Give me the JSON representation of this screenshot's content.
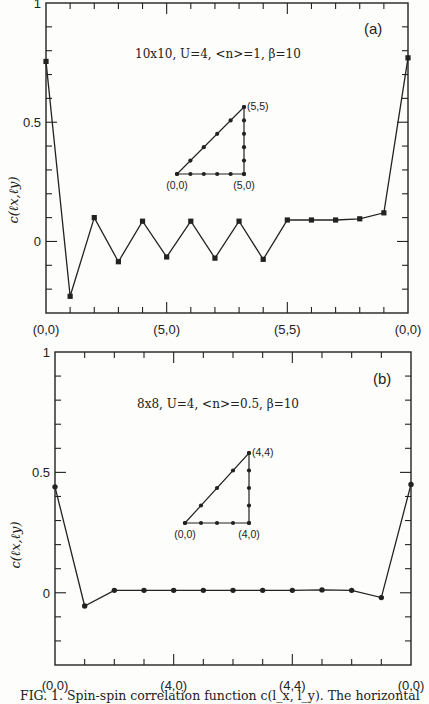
{
  "chart_data": [
    {
      "type": "line",
      "panel": "(a)",
      "title": "10x10, U=4, <n>=1, β=10",
      "ylabel": "c(l_x,l_y)",
      "xlabel": "",
      "x_tick_labels": [
        "(0,0)",
        "(5,0)",
        "(5,5)",
        "(0,0)"
      ],
      "x_tick_positions": [
        0,
        5,
        10,
        15
      ],
      "y_tick_labels": [
        "0",
        "0.5",
        "1"
      ],
      "ylim": [
        -0.3,
        1.0
      ],
      "xlim": [
        0,
        15
      ],
      "marker": "square",
      "inset": {
        "path_points": [
          "(0,0)",
          "(5,0)",
          "(5,5)"
        ],
        "n": 5
      },
      "x": [
        0,
        1,
        2,
        3,
        4,
        5,
        6,
        7,
        8,
        9,
        10,
        11,
        12,
        13,
        14,
        15
      ],
      "values": [
        0.755,
        -0.23,
        0.1,
        -0.085,
        0.085,
        -0.065,
        0.085,
        -0.07,
        0.085,
        -0.075,
        0.09,
        0.09,
        0.09,
        0.095,
        0.12,
        0.77
      ]
    },
    {
      "type": "line",
      "panel": "(b)",
      "title": "8x8, U=4, <n>=0.5, β=10",
      "ylabel": "c(l_x,l_y)",
      "xlabel": "",
      "x_tick_labels": [
        "(0,0)",
        "(4,0)",
        "(4,4)",
        "(0,0)"
      ],
      "x_tick_positions": [
        0,
        4,
        8,
        12
      ],
      "y_tick_labels": [
        "0",
        "0.5",
        "1"
      ],
      "ylim": [
        -0.3,
        1.0
      ],
      "xlim": [
        0,
        12
      ],
      "marker": "circle",
      "inset": {
        "path_points": [
          "(0,0)",
          "(4,0)",
          "(4,4)"
        ],
        "n": 4
      },
      "x": [
        0,
        1,
        2,
        3,
        4,
        5,
        6,
        7,
        8,
        9,
        10,
        11,
        12
      ],
      "values": [
        0.44,
        -0.055,
        0.01,
        0.01,
        0.01,
        0.01,
        0.01,
        0.01,
        0.01,
        0.012,
        0.01,
        -0.02,
        0.45
      ]
    }
  ],
  "caption": "FIG. 1.  Spin-spin correlation function c(l_x, l_y). The horizontal"
}
